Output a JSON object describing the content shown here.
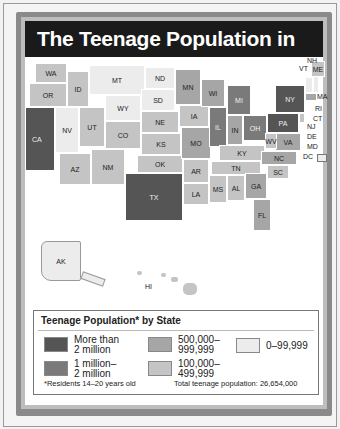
{
  "title": "The Teenage Population in 1970",
  "legend": {
    "title": "Teenage Population* by State",
    "items": [
      {
        "label_line1": "More than",
        "label_line2": "2 million",
        "color": "#555555"
      },
      {
        "label_line1": "1 million–",
        "label_line2": "2 million",
        "color": "#7a7a7a"
      },
      {
        "label_line1": "500,000–",
        "label_line2": "999,999",
        "color": "#a6a6a6"
      },
      {
        "label_line1": "100,000–",
        "label_line2": "499,999",
        "color": "#c4c4c4"
      },
      {
        "label_line1": "0–99,999",
        "label_line2": "",
        "color": "#ececec"
      }
    ],
    "footnote": "*Residents 14–20 years old",
    "total": "Total teenage population: 26,654,000"
  },
  "states": {
    "WA": "WA",
    "OR": "OR",
    "CA": "CA",
    "NV": "NV",
    "ID": "ID",
    "MT": "MT",
    "WY": "WY",
    "UT": "UT",
    "AZ": "AZ",
    "CO": "CO",
    "NM": "NM",
    "ND": "ND",
    "SD": "SD",
    "NE": "NE",
    "KS": "KS",
    "OK": "OK",
    "TX": "TX",
    "MN": "MN",
    "IA": "IA",
    "MO": "MO",
    "AR": "AR",
    "LA": "LA",
    "WI": "WI",
    "IL": "IL",
    "MI": "MI",
    "IN": "IN",
    "OH": "OH",
    "KY": "KY",
    "TN": "TN",
    "MS": "MS",
    "AL": "AL",
    "GA": "GA",
    "FL": "FL",
    "SC": "SC",
    "NC": "NC",
    "VA": "VA",
    "WV": "WV",
    "PA": "PA",
    "NY": "NY",
    "VT": "VT",
    "NH": "NH",
    "ME": "ME",
    "MA": "MA",
    "RI": "RI",
    "CT": "CT",
    "NJ": "NJ",
    "DE": "DE",
    "MD": "MD",
    "DC": "DC",
    "AK": "AK",
    "HI": "HI"
  }
}
